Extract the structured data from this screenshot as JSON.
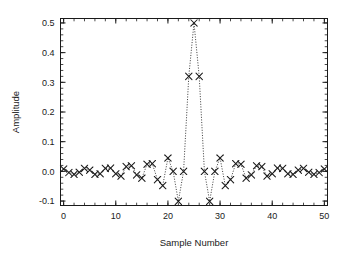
{
  "figure": {
    "background_color": "#ffffff",
    "foreground_color": "#1a1a1a"
  },
  "chart_data": {
    "type": "line",
    "title": "",
    "subtitle": "",
    "xlabel": "Sample Number",
    "ylabel": "Amplitude",
    "xlim": [
      -0.6,
      50.6
    ],
    "ylim": [
      -0.115,
      0.515
    ],
    "xticks": [
      0,
      10,
      20,
      30,
      40,
      50
    ],
    "xtick_labels": [
      "0",
      "10",
      "20",
      "30",
      "40",
      "50"
    ],
    "x_minor_tick_step": 2,
    "yticks": [
      -0.1,
      0.0,
      0.1,
      0.2,
      0.3,
      0.4,
      0.5
    ],
    "ytick_labels": [
      "-0.1",
      "0.0",
      "0.1",
      "0.2",
      "0.3",
      "0.4",
      "0.5"
    ],
    "y_minor_tick_step": 0.02,
    "grid": false,
    "legend": null,
    "legend_position": "none",
    "ticks_on_all_sides": true,
    "tick_direction": "in",
    "marker": "x",
    "marker_size": 3.2,
    "line_style": "dotted",
    "line_width": 0.8,
    "series_color": "#1a1a1a",
    "x": [
      0,
      1,
      2,
      3,
      4,
      5,
      6,
      7,
      8,
      9,
      10,
      11,
      12,
      13,
      14,
      15,
      16,
      17,
      18,
      19,
      20,
      21,
      22,
      23,
      24,
      25,
      26,
      27,
      28,
      29,
      30,
      31,
      32,
      33,
      34,
      35,
      36,
      37,
      38,
      39,
      40,
      41,
      42,
      43,
      44,
      45,
      46,
      47,
      48,
      49,
      50
    ],
    "values": [
      0.008,
      -0.004,
      -0.01,
      -0.003,
      0.01,
      0.004,
      -0.01,
      -0.008,
      0.01,
      0.011,
      -0.008,
      -0.016,
      0.016,
      0.019,
      -0.012,
      -0.023,
      0.024,
      0.026,
      -0.028,
      -0.048,
      0.045,
      0.0,
      -0.101,
      0.0,
      0.32,
      0.5,
      0.32,
      0.0,
      -0.101,
      0.0,
      0.045,
      -0.048,
      -0.028,
      0.026,
      0.024,
      -0.023,
      -0.012,
      0.019,
      0.016,
      -0.016,
      -0.008,
      0.011,
      0.01,
      -0.008,
      -0.01,
      0.004,
      0.01,
      -0.003,
      -0.01,
      -0.004,
      0.008
    ],
    "series": [
      {
        "name": "impulse response",
        "values": [
          0.008,
          -0.004,
          -0.01,
          -0.003,
          0.01,
          0.004,
          -0.01,
          -0.008,
          0.01,
          0.011,
          -0.008,
          -0.016,
          0.016,
          0.019,
          -0.012,
          -0.023,
          0.024,
          0.026,
          -0.028,
          -0.048,
          0.045,
          0.0,
          -0.101,
          0.0,
          0.32,
          0.5,
          0.32,
          0.0,
          -0.101,
          0.0,
          0.045,
          -0.048,
          -0.028,
          0.026,
          0.024,
          -0.023,
          -0.012,
          0.019,
          0.016,
          -0.016,
          -0.008,
          0.011,
          0.01,
          -0.008,
          -0.01,
          0.004,
          0.01,
          -0.003,
          -0.01,
          -0.004,
          0.008
        ]
      }
    ]
  }
}
